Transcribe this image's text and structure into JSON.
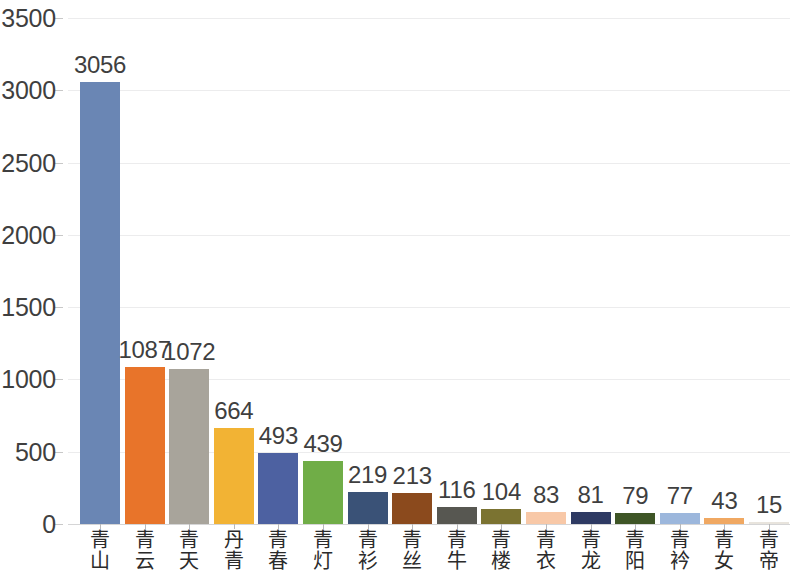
{
  "chart_data": {
    "type": "bar",
    "title": "",
    "subtitle": "",
    "xlabel": "",
    "ylabel": "",
    "ylim": [
      0,
      3500
    ],
    "ytick_values": [
      0,
      500,
      1000,
      1500,
      2000,
      2500,
      3000,
      3500
    ],
    "ytick_labels": [
      "0",
      "500",
      "1000",
      "1500",
      "2000",
      "2500",
      "3000",
      "3500"
    ],
    "grid": true,
    "legend": "none",
    "categories": [
      "青山",
      "青云",
      "青天",
      "丹青",
      "青春",
      "青灯",
      "青衫",
      "青丝",
      "青牛",
      "青楼",
      "青衣",
      "青龙",
      "青阳",
      "青衿",
      "青女",
      "青帝"
    ],
    "values": [
      3056,
      1087,
      1072,
      664,
      493,
      439,
      219,
      213,
      116,
      104,
      83,
      81,
      79,
      77,
      43,
      15
    ],
    "value_labels": [
      "3056",
      "1087",
      "1072",
      "664",
      "493",
      "439",
      "219",
      "213",
      "116",
      "104",
      "83",
      "81",
      "79",
      "77",
      "43",
      "15"
    ],
    "bar_colors": [
      "#6A86B4",
      "#E8742A",
      "#A8A49B",
      "#F2B334",
      "#4D61A1",
      "#70AD47",
      "#3A5277",
      "#8B4A1D",
      "#575751",
      "#7B7331",
      "#F8C8A7",
      "#2E3A63",
      "#3E5526",
      "#9CB7DC",
      "#F0A862",
      "#E8E4DD"
    ]
  }
}
